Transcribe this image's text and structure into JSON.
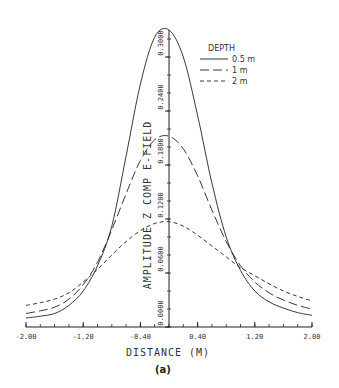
{
  "chart_data": {
    "type": "line",
    "title": "",
    "caption": "(a)",
    "xlabel": "DISTANCE (M)",
    "ylabel": "AMPLITUDE Z COMP E-FIELD",
    "xlim": [
      -2.0,
      2.0
    ],
    "ylim": [
      0.0,
      0.33
    ],
    "x_ticks": [
      -2.0,
      -1.2,
      -0.4,
      0.4,
      1.2,
      2.0
    ],
    "x_tick_labels": [
      "-2.00",
      "-1.20",
      "-0.40",
      "0.40",
      "1.20",
      "2.00"
    ],
    "y_ticks": [
      0.0,
      0.06,
      0.12,
      0.18,
      0.24,
      0.3
    ],
    "y_tick_labels": [
      "0.0000",
      "0.0600",
      "0.1200",
      "0.1800",
      "0.2400",
      "0.3000"
    ],
    "grid": false,
    "legend": {
      "title": "DEPTH",
      "position": "top-right"
    },
    "x": [
      -2.0,
      -1.8,
      -1.6,
      -1.4,
      -1.2,
      -1.0,
      -0.8,
      -0.6,
      -0.4,
      -0.2,
      0.0,
      0.2,
      0.4,
      0.6,
      0.8,
      1.0,
      1.2,
      1.4,
      1.6,
      1.8,
      2.0
    ],
    "series": [
      {
        "name": "0.5 m",
        "style": "solid",
        "values": [
          0.01,
          0.012,
          0.015,
          0.024,
          0.04,
          0.068,
          0.112,
          0.19,
          0.27,
          0.322,
          0.33,
          0.3,
          0.235,
          0.16,
          0.1,
          0.063,
          0.04,
          0.028,
          0.021,
          0.016,
          0.013
        ]
      },
      {
        "name": "1 m",
        "style": "long-dash",
        "values": [
          0.015,
          0.018,
          0.022,
          0.031,
          0.047,
          0.072,
          0.108,
          0.148,
          0.185,
          0.208,
          0.212,
          0.198,
          0.168,
          0.13,
          0.095,
          0.068,
          0.05,
          0.038,
          0.03,
          0.024,
          0.02
        ]
      },
      {
        "name": "2 m",
        "style": "short-dash",
        "values": [
          0.024,
          0.027,
          0.031,
          0.038,
          0.05,
          0.064,
          0.08,
          0.095,
          0.107,
          0.115,
          0.117,
          0.112,
          0.102,
          0.09,
          0.078,
          0.066,
          0.057,
          0.048,
          0.04,
          0.034,
          0.029
        ]
      }
    ],
    "colors": {
      "line": "#222222",
      "axis": "#222222"
    }
  }
}
